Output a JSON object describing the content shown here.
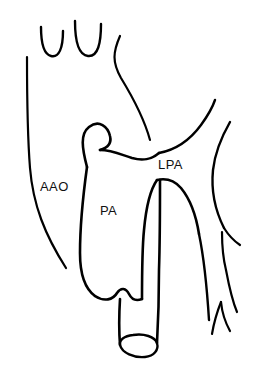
{
  "figure": {
    "kind": "anatomical-line-drawing",
    "background_color": "#ffffff",
    "line_color": "#000000",
    "label_color": "#111111",
    "width": 259,
    "height": 366
  },
  "labels": [
    {
      "id": "aao",
      "text": "AAO",
      "meaning": "ascending aorta",
      "x": 40,
      "y": 191,
      "font_size": 13
    },
    {
      "id": "pa",
      "text": "PA",
      "meaning": "pulmonary artery",
      "x": 100,
      "y": 215,
      "font_size": 13
    },
    {
      "id": "lpa",
      "text": "LPA",
      "meaning": "left pulmonary artery",
      "x": 158,
      "y": 169,
      "font_size": 13
    }
  ],
  "structures": [
    {
      "id": "aortic-arch-left-wall",
      "name": "aortic-arch-left-wall",
      "stroke_width": 2.2,
      "path": "M 27 57 C 27 90, 27 130, 30 168 C 33 205, 45 235, 66 268"
    },
    {
      "id": "brachiocephalic-stump-left",
      "name": "branch-vessel-stump-left",
      "stroke_width": 2.4,
      "path": "M 41 27 C 41 42, 43 54, 51 56 C 59 58, 63 48, 63 31"
    },
    {
      "id": "brachiocephalic-stump-right",
      "name": "branch-vessel-stump-right",
      "stroke_width": 2.4,
      "path": "M 75 21 C 75 40, 78 55, 88 56 C 98 57, 101 43, 101 24"
    },
    {
      "id": "superior-descending-line",
      "name": "superior-vessel-descending-line",
      "stroke_width": 2.2,
      "path": "M 120 36 C 113 52, 112 62, 121 78 C 132 96, 144 118, 150 140"
    },
    {
      "id": "pa-left-wall",
      "name": "pulmonary-artery-left-wall",
      "stroke_width": 2.6,
      "path": "M 87 167 C 83 196, 80 226, 80 253 C 80 274, 84 288, 95 296"
    },
    {
      "id": "pa-appendage-loop",
      "name": "pulmonary-artery-stump-loop",
      "stroke_width": 2.6,
      "path": "M 87 167 C 82 148, 80 134, 89 127 C 99 119, 108 127, 110 136 C 112 144, 107 148, 100 150"
    },
    {
      "id": "pa-superior-wall",
      "name": "pulmonary-artery-superior-wall",
      "stroke_width": 2.6,
      "path": "M 100 150 C 112 150, 122 155, 132 158 C 143 161, 151 160, 159 153"
    },
    {
      "id": "pa-inferior-contour",
      "name": "pulmonary-artery-inferior-contour",
      "stroke_width": 2.6,
      "path": "M 95 296 C 104 302, 113 300, 117 293 C 121 287, 126 288, 129 294 C 132 300, 137 301, 142 299"
    },
    {
      "id": "pa-right-wall",
      "name": "pulmonary-artery-right-wall",
      "stroke_width": 2.6,
      "path": "M 142 299 C 142 276, 142 250, 144 230 C 146 208, 150 190, 157 180"
    },
    {
      "id": "lpa-arch-left",
      "name": "left-pulmonary-artery-inferior-left-wall",
      "stroke_width": 2.6,
      "path": "M 157 180 C 166 178, 174 180, 181 188 C 190 199, 196 215, 199 234"
    },
    {
      "id": "lpa-arch-right",
      "name": "left-pulmonary-artery-descending-wall",
      "stroke_width": 2.4,
      "path": "M 199 234 C 204 258, 207 288, 209 320"
    },
    {
      "id": "lpa-superior-contour",
      "name": "left-pulmonary-artery-superior-contour",
      "stroke_width": 2.4,
      "path": "M 159 153 C 175 150, 190 140, 201 125 C 209 114, 213 106, 215 100"
    },
    {
      "id": "right-vessel-outer-wall",
      "name": "right-vessel-outer-wall",
      "stroke_width": 2.4,
      "path": "M 230 122 C 222 136, 215 152, 213 170 C 211 190, 215 210, 224 228"
    },
    {
      "id": "right-vessel-branch-upper",
      "name": "right-vessel-branch-upper",
      "stroke_width": 2.2,
      "path": "M 224 228 C 229 236, 234 241, 240 245"
    },
    {
      "id": "right-branch-notch-upper",
      "name": "right-branch-notch-upper",
      "stroke_width": 2.2,
      "path": "M 222 232 C 222 245, 223 258, 226 270"
    },
    {
      "id": "right-branch-lower-fork",
      "name": "right-branch-lower-fork",
      "stroke_width": 2.2,
      "path": "M 226 270 C 229 286, 232 300, 237 312"
    },
    {
      "id": "right-branch-notch-lower",
      "name": "right-branch-notch-lower",
      "stroke_width": 2.2,
      "path": "M 221 302 C 222 312, 225 322, 230 331"
    },
    {
      "id": "right-branch-lower-tail",
      "name": "right-branch-lower-tail",
      "stroke_width": 2.2,
      "path": "M 221 302 C 217 312, 214 322, 212 334"
    },
    {
      "id": "conduit-left-wall",
      "name": "conduit-left-wall",
      "stroke_width": 2.6,
      "path": "M 120 299 C 119 315, 119 332, 120 345"
    },
    {
      "id": "conduit-right-wall",
      "name": "conduit-right-wall",
      "stroke_width": 2.6,
      "path": "M 160 180 C 160 210, 160 240, 159 270 C 159 300, 158 325, 157 343"
    },
    {
      "id": "conduit-rim",
      "name": "conduit-distal-rim-ellipse",
      "stroke_width": 2.4,
      "path": "M 120 345 C 122 353, 134 358, 145 357 C 154 356, 159 350, 157 343 C 155 337, 144 333, 133 335 C 124 336, 119 340, 120 345 Z"
    }
  ]
}
